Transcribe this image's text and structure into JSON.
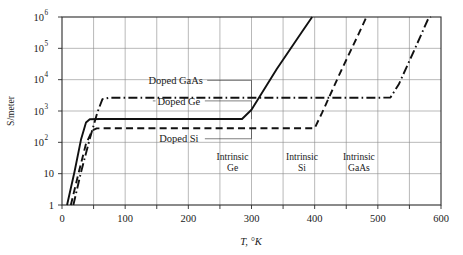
{
  "chart_data": {
    "type": "line",
    "title": "",
    "xlabel": "T, °K",
    "ylabel": "S/meter",
    "xlim": [
      0,
      600
    ],
    "ylim": [
      1,
      1000000
    ],
    "yscale": "log",
    "grid": true,
    "legend_position": "inline-annotations",
    "x_ticks": [
      {
        "value": 0,
        "label": "0"
      },
      {
        "value": 100,
        "label": "100"
      },
      {
        "value": 200,
        "label": "200"
      },
      {
        "value": 300,
        "label": "300"
      },
      {
        "value": 400,
        "label": "400"
      },
      {
        "value": 500,
        "label": "500"
      },
      {
        "value": 600,
        "label": "600"
      }
    ],
    "x_minor_ticks": [
      50,
      150,
      250,
      350,
      450,
      550
    ],
    "y_ticks": [
      {
        "value": 1,
        "base": "1",
        "exp": ""
      },
      {
        "value": 10,
        "base": "10",
        "exp": ""
      },
      {
        "value": 100,
        "base": "10",
        "exp": "2"
      },
      {
        "value": 1000,
        "base": "10",
        "exp": "3"
      },
      {
        "value": 10000,
        "base": "10",
        "exp": "4"
      },
      {
        "value": 100000,
        "base": "10",
        "exp": "5"
      },
      {
        "value": 1000000,
        "base": "10",
        "exp": "6"
      }
    ],
    "series": [
      {
        "name": "Ge",
        "style": "solid",
        "doped_label": "Doped Ge",
        "intrinsic_label_line1": "Intrinsic",
        "intrinsic_label_line2": "Ge",
        "plateau_value": 550,
        "points": [
          {
            "x": 8,
            "y": 1
          },
          {
            "x": 20,
            "y": 12
          },
          {
            "x": 30,
            "y": 120
          },
          {
            "x": 38,
            "y": 430
          },
          {
            "x": 44,
            "y": 545
          },
          {
            "x": 60,
            "y": 555
          },
          {
            "x": 200,
            "y": 555
          },
          {
            "x": 285,
            "y": 555
          },
          {
            "x": 300,
            "y": 1100
          },
          {
            "x": 340,
            "y": 22000
          },
          {
            "x": 380,
            "y": 340000
          },
          {
            "x": 396,
            "y": 1000000
          }
        ]
      },
      {
        "name": "Si",
        "style": "dashed",
        "doped_label": "Doped Si",
        "intrinsic_label_line1": "Intrinsic",
        "intrinsic_label_line2": "Si",
        "plateau_value": 280,
        "points": [
          {
            "x": 14,
            "y": 1
          },
          {
            "x": 26,
            "y": 10
          },
          {
            "x": 38,
            "y": 90
          },
          {
            "x": 48,
            "y": 240
          },
          {
            "x": 55,
            "y": 278
          },
          {
            "x": 80,
            "y": 283
          },
          {
            "x": 300,
            "y": 283
          },
          {
            "x": 400,
            "y": 283
          },
          {
            "x": 412,
            "y": 900
          },
          {
            "x": 440,
            "y": 16000
          },
          {
            "x": 470,
            "y": 300000
          },
          {
            "x": 482,
            "y": 1000000
          }
        ]
      },
      {
        "name": "GaAs",
        "style": "dash-dot",
        "doped_label": "Doped GaAs",
        "intrinsic_label_line1": "Intrinsic",
        "intrinsic_label_line2": "GaAs",
        "plateau_value": 2600,
        "points": [
          {
            "x": 18,
            "y": 1
          },
          {
            "x": 30,
            "y": 11
          },
          {
            "x": 44,
            "y": 130
          },
          {
            "x": 56,
            "y": 900
          },
          {
            "x": 64,
            "y": 2400
          },
          {
            "x": 75,
            "y": 2650
          },
          {
            "x": 300,
            "y": 2650
          },
          {
            "x": 500,
            "y": 2650
          },
          {
            "x": 520,
            "y": 2700
          },
          {
            "x": 533,
            "y": 7000
          },
          {
            "x": 558,
            "y": 90000
          },
          {
            "x": 580,
            "y": 900000
          },
          {
            "x": 584,
            "y": 1000000
          }
        ]
      }
    ],
    "annotations": [
      {
        "text": "Doped GaAs",
        "x": 180,
        "y_value": 9500
      },
      {
        "text": "Doped Ge",
        "x": 185,
        "y_value": 2100
      },
      {
        "text": "Doped Si",
        "x": 185,
        "y_value": 130
      },
      {
        "text": "Intrinsic Ge",
        "x": 270,
        "y_value": 28
      },
      {
        "text": "Intrinsic Si",
        "x": 380,
        "y_value": 28
      },
      {
        "text": "Intrinsic GaAs",
        "x": 470,
        "y_value": 28
      }
    ]
  }
}
